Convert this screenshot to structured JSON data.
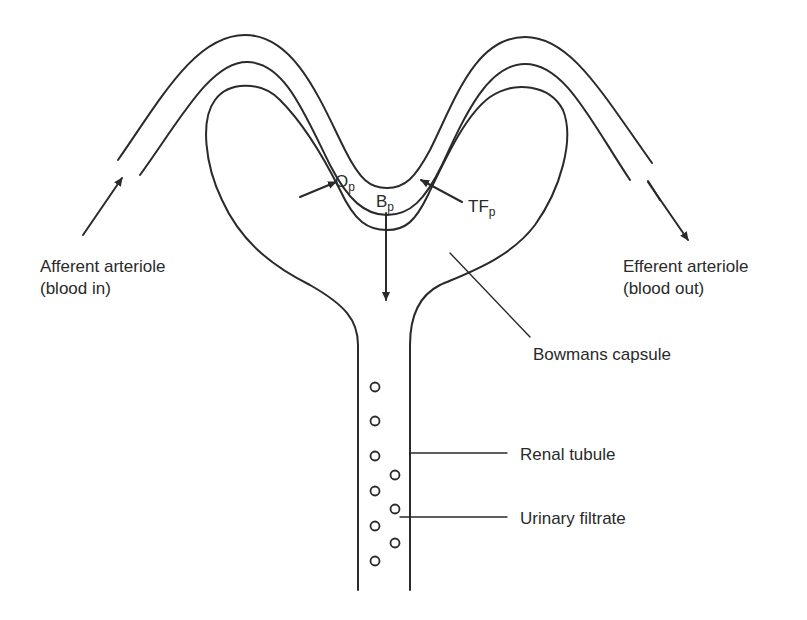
{
  "diagram": {
    "stroke_color": "#2a2a2a",
    "background": "#ffffff"
  },
  "labels": {
    "afferent_line1": "Afferent arteriole",
    "afferent_line2": "(blood in)",
    "efferent_line1": "Efferent arteriole",
    "efferent_line2": "(blood out)",
    "bowmans": "Bowmans capsule",
    "renal_tubule": "Renal tubule",
    "urinary_filtrate": "Urinary filtrate"
  },
  "pressures": {
    "op_main": "O",
    "op_sub": "p",
    "bp_main": "B",
    "bp_sub": "p",
    "tfp_main": "TF",
    "tfp_sub": "p"
  },
  "filtrate_particles": [
    {
      "x": 375,
      "y": 387
    },
    {
      "x": 375,
      "y": 421
    },
    {
      "x": 375,
      "y": 456
    },
    {
      "x": 375,
      "y": 491
    },
    {
      "x": 375,
      "y": 526
    },
    {
      "x": 375,
      "y": 561
    },
    {
      "x": 395,
      "y": 475
    },
    {
      "x": 395,
      "y": 509
    },
    {
      "x": 395,
      "y": 543
    }
  ]
}
